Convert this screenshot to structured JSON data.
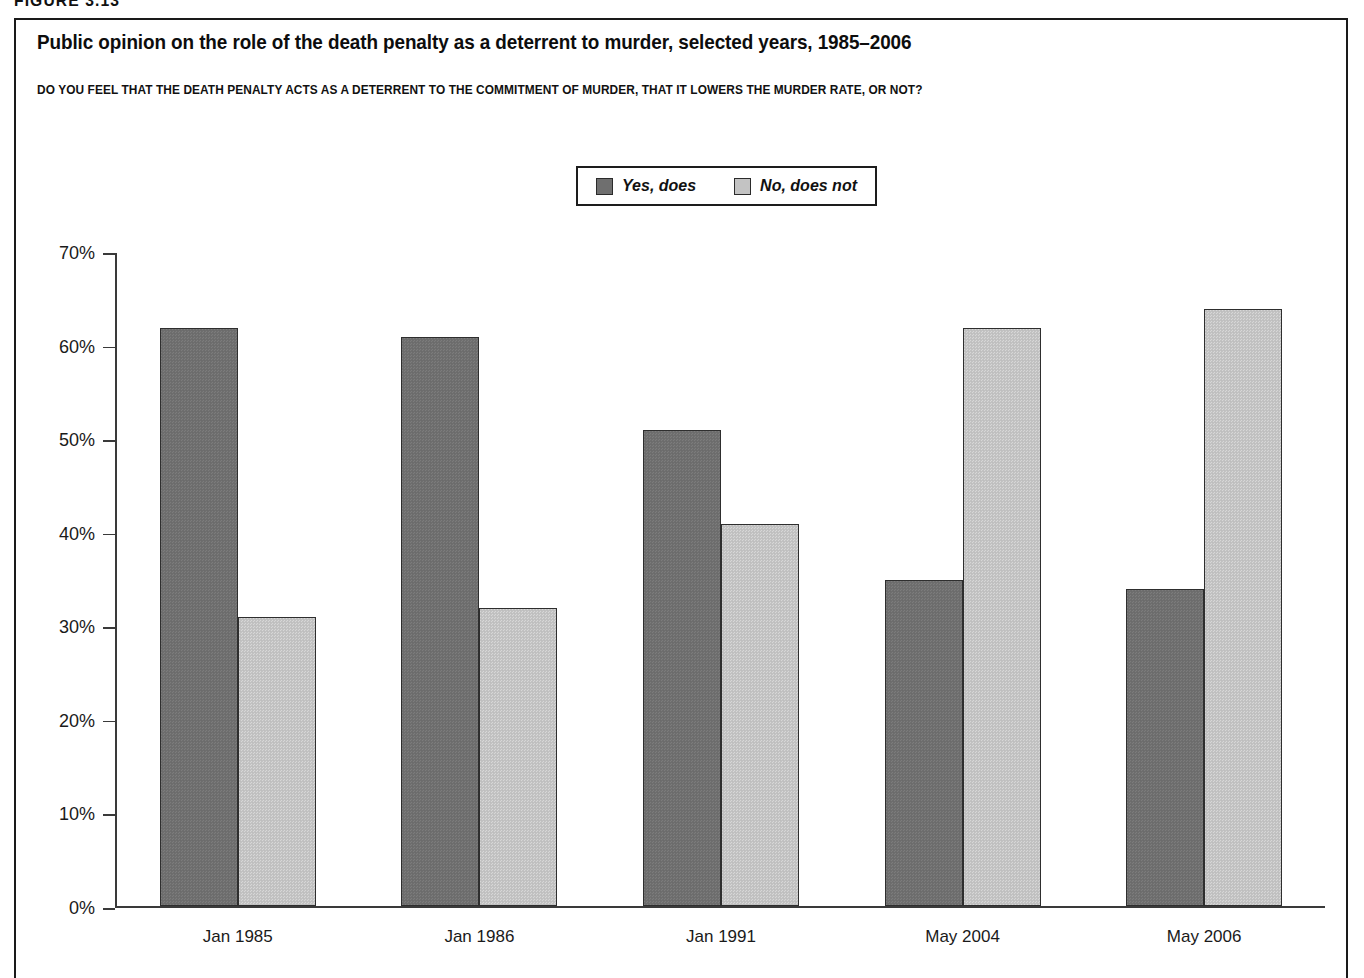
{
  "figure_number": "FIGURE 3.13",
  "title": "Public opinion on the role of the death penalty as a deterrent to murder, selected years, 1985–2006",
  "subtitle": "DO YOU FEEL THAT THE DEATH PENALTY ACTS AS A DETERRENT TO THE COMMITMENT OF MURDER, THAT IT LOWERS THE MURDER RATE, OR NOT?",
  "legend": {
    "items": [
      {
        "label": "Yes, does",
        "color": "#6f6f6f",
        "swatch": "dark"
      },
      {
        "label": "No, does not",
        "color": "#c3c3c3",
        "swatch": "light"
      }
    ]
  },
  "axis": {
    "y_ticks": [
      "70%",
      "60%",
      "50%",
      "40%",
      "30%",
      "20%",
      "10%",
      "0%"
    ],
    "y_tick_values": [
      70,
      60,
      50,
      40,
      30,
      20,
      10,
      0
    ],
    "y_min": 0,
    "y_max": 70
  },
  "chart_data": {
    "type": "bar",
    "title": "Public opinion on the role of the death penalty as a deterrent to murder, selected years, 1985–2006",
    "subtitle": "DO YOU FEEL THAT THE DEATH PENALTY ACTS AS A DETERRENT TO THE COMMITMENT OF MURDER, THAT IT LOWERS THE MURDER RATE, OR NOT?",
    "categories": [
      "Jan 1985",
      "Jan 1986",
      "Jan 1991",
      "May 2004",
      "May 2006"
    ],
    "series": [
      {
        "name": "Yes, does",
        "color": "#6f6f6f",
        "values": [
          62,
          61,
          51,
          35,
          34
        ]
      },
      {
        "name": "No, does not",
        "color": "#c3c3c3",
        "values": [
          31,
          32,
          41,
          62,
          64
        ]
      }
    ],
    "xlabel": "",
    "ylabel": "",
    "ylim": [
      0,
      70
    ],
    "ytick_labels": [
      "0%",
      "10%",
      "20%",
      "30%",
      "40%",
      "50%",
      "60%",
      "70%"
    ],
    "grid": false,
    "legend_position": "top-center",
    "units": "percent"
  }
}
